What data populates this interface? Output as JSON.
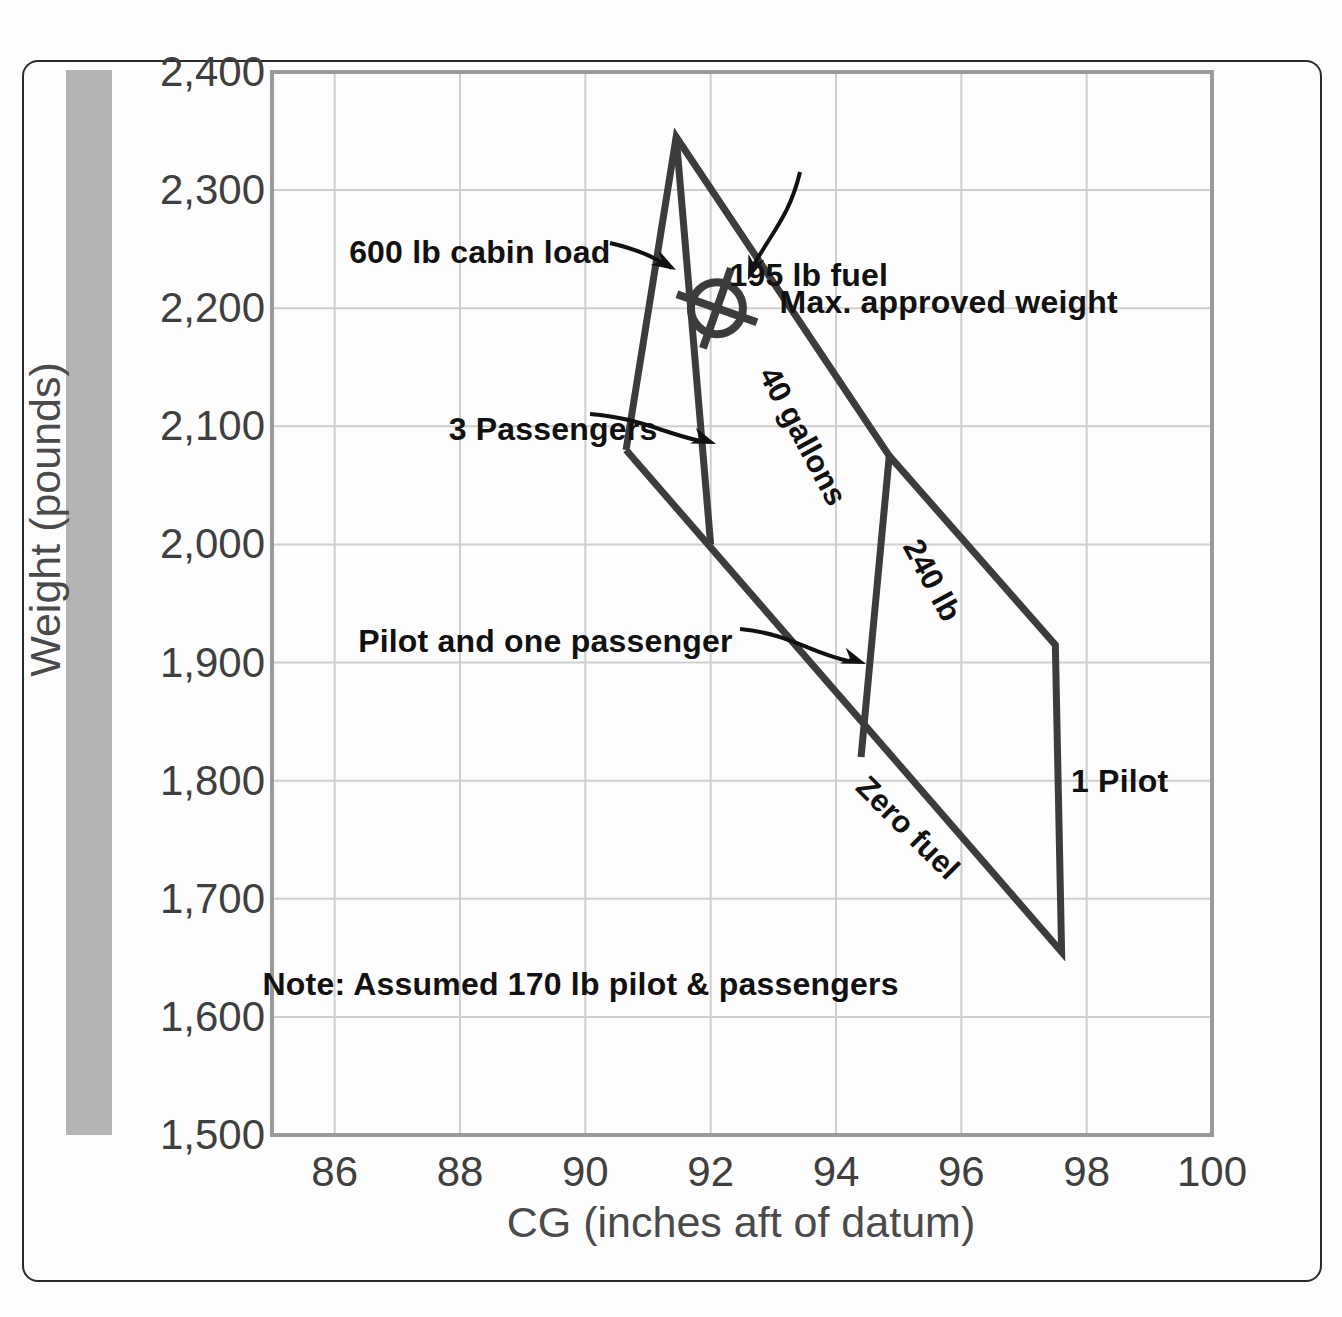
{
  "chart_data": {
    "type": "line",
    "title": "",
    "xlabel": "CG (inches aft of datum)",
    "ylabel": "Weight (pounds)",
    "xlim": [
      85,
      100
    ],
    "ylim": [
      1500,
      2400
    ],
    "xticks": [
      86,
      88,
      90,
      92,
      94,
      96,
      98,
      100
    ],
    "xtick_labels": [
      "86",
      "88",
      "90",
      "92",
      "94",
      "96",
      "98",
      "100"
    ],
    "yticks": [
      1500,
      1600,
      1700,
      1800,
      1900,
      2000,
      2100,
      2200,
      2300,
      2400
    ],
    "ytick_labels": [
      "1,500",
      "1,600",
      "1,700",
      "1,800",
      "1,900",
      "2,000",
      "2,100",
      "2,200",
      "2,300",
      "2,400"
    ],
    "grid": true,
    "legend": "none",
    "series": [
      {
        "name": "Loading envelope outline",
        "points": [
          [
            90.65,
            2080
          ],
          [
            91.45,
            2345
          ],
          [
            94.85,
            2075
          ],
          [
            97.5,
            1915
          ],
          [
            97.6,
            1655
          ],
          [
            90.65,
            2080
          ]
        ]
      },
      {
        "name": "600 lb cabin load / 3 passengers line",
        "points": [
          [
            91.45,
            2345
          ],
          [
            92.0,
            2000
          ]
        ]
      },
      {
        "name": "1 Pilot / pilot and one passenger line",
        "points": [
          [
            94.85,
            2075
          ],
          [
            94.4,
            1820
          ]
        ]
      }
    ],
    "annotations": [
      {
        "id": "fuel-195",
        "text": "195 lb fuel",
        "x": 92.3,
        "y": 2225
      },
      {
        "id": "cabin-load-600",
        "text": "600 lb cabin load",
        "x": 90.5,
        "y": 2248
      },
      {
        "id": "max-approved-weight",
        "text": "Max. approved weight",
        "x": 93.2,
        "y": 2205
      },
      {
        "id": "passengers-3",
        "text": "3 Passengers",
        "x": 91.3,
        "y": 2100
      },
      {
        "id": "gallons-40",
        "text": "40 gallons",
        "x": 93.4,
        "y": 2150
      },
      {
        "id": "lb-240",
        "text": "240 lb",
        "x": 95.6,
        "y": 1990
      },
      {
        "id": "pilot-one-passenger",
        "text": "Pilot and one passenger",
        "x": 91.9,
        "y": 1918
      },
      {
        "id": "zero-fuel",
        "text": "Zero fuel",
        "x": 95.0,
        "y": 1780
      },
      {
        "id": "pilot-1",
        "text": "1 Pilot",
        "x": 97.8,
        "y": 1800
      },
      {
        "id": "note",
        "text": "Note: Assumed 170 lb pilot & passengers",
        "x": 92.0,
        "y": 1630
      }
    ],
    "markers": [
      {
        "id": "cg-point",
        "shape": "circle-crosshair",
        "x": 92.1,
        "y": 2200,
        "label": ""
      }
    ]
  },
  "axes": {
    "y_title": "Weight (pounds)",
    "x_title": "CG (inches aft of datum)"
  },
  "labels": {
    "fuel_195": "195 lb fuel",
    "cabin_load_600": "600 lb cabin load",
    "max_approved_weight": "Max. approved weight",
    "passengers_3": "3 Passengers",
    "gallons_40": "40 gallons",
    "lb_240": "240 lb",
    "pilot_one_passenger": "Pilot and one passenger",
    "zero_fuel": "Zero fuel",
    "pilot_1": "1 Pilot",
    "note": "Note: Assumed 170 lb pilot & passengers"
  },
  "colors": {
    "envelope_line": "#3c3c3c",
    "grid": "#cfcfcf",
    "axis": "#9a9a9a",
    "gray_bar": "#b4b4b4",
    "text": "#111111",
    "tick_text": "#3f3f3f"
  }
}
